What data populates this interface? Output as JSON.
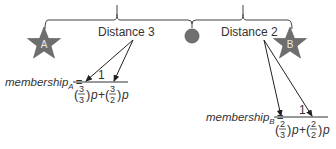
{
  "diagram": {
    "labels": {
      "distance_left": "Distance 3",
      "distance_right": "Distance 2"
    },
    "nodes": {
      "star_a": {
        "label": "A",
        "color": "#6e6e6e"
      },
      "star_b": {
        "label": "B",
        "color": "#6e6e6e"
      },
      "midpoint": {
        "color": "#707070"
      }
    },
    "formula_a": {
      "lhs": "membership",
      "subscript": "A",
      "equals": "=",
      "numerator": "1",
      "term1_num": "3",
      "term1_den": "3",
      "term2_num": "3",
      "term2_den": "2",
      "var": "p",
      "plus": "+"
    },
    "formula_b": {
      "lhs": "membership",
      "subscript": "B",
      "equals": "=",
      "numerator": "1",
      "term1_num": "2",
      "term1_den": "3",
      "term2_num": "2",
      "term2_den": "2",
      "var": "p",
      "plus": "+"
    }
  }
}
